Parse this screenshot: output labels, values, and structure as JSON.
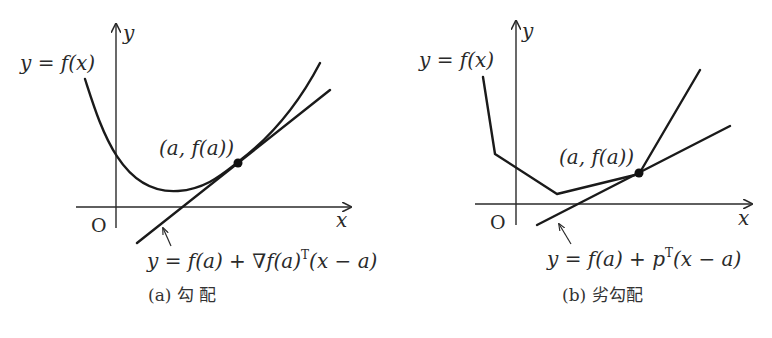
{
  "panels": [
    {
      "id": "a",
      "function_label": "y = f(x)",
      "y_axis_label": "y",
      "x_axis_label": "x",
      "origin_label": "O",
      "point_label": "(a, f(a))",
      "tangent_label_prefix": "y = f(a) + ∇f(a)",
      "tangent_label_sup": "T",
      "tangent_label_suffix": "(x − a)",
      "caption": "(a)  勾   配",
      "curve_type": "smooth convex (differentiable)"
    },
    {
      "id": "b",
      "function_label": "y = f(x)",
      "y_axis_label": "y",
      "x_axis_label": "x",
      "origin_label": "O",
      "point_label": "(a, f(a))",
      "tangent_label_prefix": "y = f(a) + p",
      "tangent_label_sup": "T",
      "tangent_label_suffix": "(x − a)",
      "caption": "(b) 劣勾配",
      "curve_type": "piecewise-linear convex (non-differentiable at a)"
    }
  ]
}
